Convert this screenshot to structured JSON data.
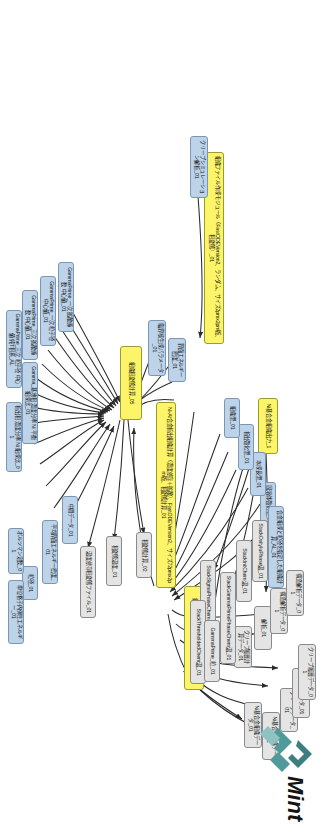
{
  "app": {
    "title": "Mint",
    "logo_text": "Mint",
    "logo_mark": "mint-chevron-mark",
    "brand_color": "#4f9a9a",
    "logo_text_color": "#141414"
  },
  "legend": {
    "yellow_label": "process-node",
    "blue_label": "input-node",
    "gray_label": "output-node",
    "yellow_color": "#fdf569",
    "blue_color": "#bcd3ea",
    "gray_color": "#e4e4e4",
    "edge_color": "#2b2b2b"
  },
  "diagram": {
    "type": "dataflow-graph",
    "orientation": "rotated-90-clockwise",
    "node_count": 42,
    "edge_count": 48
  },
  "nodes": [
    {
      "id": "n1",
      "kind": "yellow",
      "label": "組織ファイル作成モジュール（FastODEVersion2、ランダム、サイズ2pmx2pm版、相変態）_01"
    },
    {
      "id": "n2",
      "kind": "yellow",
      "label": "Ni-Al合金析出組織計算（濃度依存＋拡散）、FastODEVersion2、サイズ72pmx2pm版、相変態計算_01"
    },
    {
      "id": "n3",
      "kind": "yellow",
      "label": "組織出力モジュール、Dupin計算_04"
    },
    {
      "id": "n4",
      "kind": "yellow",
      "label": "Ni基合金組織出力_1"
    },
    {
      "id": "n5",
      "kind": "yellow",
      "label": "組織相変態計算_05"
    },
    {
      "id": "b1",
      "kind": "blue",
      "label": "クリープシミュレーション解析_01"
    },
    {
      "id": "b2",
      "kind": "blue",
      "label": "固溶体強化型_01"
    },
    {
      "id": "b3",
      "kind": "blue",
      "label": "本成長型_01"
    },
    {
      "id": "b4",
      "kind": "blue",
      "label": "析出強化型_01"
    },
    {
      "id": "b5",
      "kind": "blue",
      "label": "組織型_01"
    },
    {
      "id": "b6",
      "kind": "blue",
      "label": "合金組成と粒径を指定した組織計算_AL_01"
    },
    {
      "id": "b7",
      "kind": "blue",
      "label": "界面エネルギー密度_01"
    },
    {
      "id": "b8",
      "kind": "blue",
      "label": "臨界核生成パラメータ_01"
    },
    {
      "id": "b9",
      "kind": "blue",
      "label": "GammaPrime_一次 拡散係数 中心値_01"
    },
    {
      "id": "b10",
      "kind": "blue",
      "label": "GammaPrime_一次 粒子径 中心値_01"
    },
    {
      "id": "b11",
      "kind": "blue",
      "label": "GammaPrime_三次 拡散係数 中心値_01"
    },
    {
      "id": "b12",
      "kind": "blue",
      "label": "GammaPrime_三次 粒子径 中心値 純T相系_AL"
    },
    {
      "id": "b13",
      "kind": "blue",
      "label": "Gamma_基地相 濃度分率 Ni 平衡 組成比_01"
    },
    {
      "id": "b14",
      "kind": "blue",
      "label": "析出相 濃度分率 Ni 組成比_01"
    },
    {
      "id": "b15",
      "kind": "blue",
      "label": "中間データ_01"
    },
    {
      "id": "b16",
      "kind": "blue",
      "label": "平均界面エネルギー密度_01"
    },
    {
      "id": "b17",
      "kind": "blue",
      "label": "粒径_01"
    },
    {
      "id": "b18",
      "kind": "blue",
      "label": "ボルツマン定数_01"
    },
    {
      "id": "b19",
      "kind": "blue",
      "label": "単位格子内弾性エネルギー_01"
    },
    {
      "id": "g1",
      "kind": "gray",
      "label": "Ni基合金組織データ_01"
    },
    {
      "id": "g2",
      "kind": "gray",
      "label": "Ni基合金組織データ_01"
    },
    {
      "id": "g3",
      "kind": "gray",
      "label": "クリープデータ_01"
    },
    {
      "id": "g4",
      "kind": "gray",
      "label": "クリープデータ_01"
    },
    {
      "id": "g5",
      "kind": "gray",
      "label": "クリープ履歴データ_01"
    },
    {
      "id": "g6",
      "kind": "gray",
      "label": "クリープ履歴計算データ_01"
    },
    {
      "id": "g7",
      "kind": "gray",
      "label": "解析_01"
    },
    {
      "id": "g8",
      "kind": "gray",
      "label": "構造解析データ_01"
    },
    {
      "id": "g9",
      "kind": "gray",
      "label": "構造解析データ_01"
    },
    {
      "id": "s1",
      "kind": "gray",
      "label": "StackSigmaPhaseChem温_01"
    },
    {
      "id": "s2",
      "kind": "gray",
      "label": "StackGammaPrimePhaseChem温_01"
    },
    {
      "id": "s3",
      "kind": "gray",
      "label": "StackInitChem温_01"
    },
    {
      "id": "s4",
      "kind": "gray",
      "label": "StackOxityIuPhase温_01"
    },
    {
      "id": "s5",
      "kind": "gray",
      "label": "StackThresholdedChem温_01"
    },
    {
      "id": "s6",
      "kind": "gray",
      "label": "GammaPrime_粒_01"
    },
    {
      "id": "g10",
      "kind": "gray",
      "label": "相変態計算_02"
    },
    {
      "id": "g11",
      "kind": "gray",
      "label": "相変態温度_01"
    },
    {
      "id": "g12",
      "kind": "gray",
      "label": "温度依存相変態ファイル_01"
    }
  ]
}
